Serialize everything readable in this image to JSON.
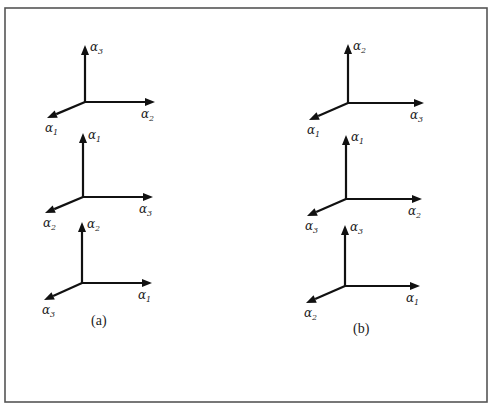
{
  "figure": {
    "panels": [
      {
        "caption": "(a)",
        "frames": [
          {
            "up": "α",
            "up_sub": "3",
            "right": "α",
            "right_sub": "2",
            "diag": "α",
            "diag_sub": "1"
          },
          {
            "up": "α",
            "up_sub": "1",
            "right": "α",
            "right_sub": "3",
            "diag": "α",
            "diag_sub": "2"
          },
          {
            "up": "α",
            "up_sub": "2",
            "right": "α",
            "right_sub": "1",
            "diag": "α",
            "diag_sub": "3"
          }
        ]
      },
      {
        "caption": "(b)",
        "frames": [
          {
            "up": "α",
            "up_sub": "2",
            "right": "α",
            "right_sub": "3",
            "diag": "α",
            "diag_sub": "1"
          },
          {
            "up": "α",
            "up_sub": "1",
            "right": "α",
            "right_sub": "2",
            "diag": "α",
            "diag_sub": "3"
          },
          {
            "up": "α",
            "up_sub": "3",
            "right": "α",
            "right_sub": "1",
            "diag": "α",
            "diag_sub": "2"
          }
        ]
      }
    ]
  }
}
